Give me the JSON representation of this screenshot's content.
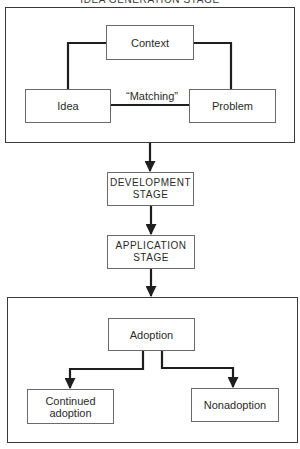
{
  "diagram": {
    "title": "IDEA GENERATION STAGE",
    "idea_stage": {
      "nodes": {
        "context": "Context",
        "idea": "Idea",
        "problem": "Problem"
      },
      "edge_label": "“Matching”"
    },
    "stages": [
      {
        "line1": "DEVELOPMENT",
        "line2": "STAGE"
      },
      {
        "line1": "APPLICATION",
        "line2": "STAGE"
      }
    ],
    "outcome_stage": {
      "nodes": {
        "adoption": "Adoption",
        "continued_line1": "Continued",
        "continued_line2": "adoption",
        "nonadoption": "Nonadoption"
      }
    },
    "colors": {
      "line": "#1e1e1e",
      "box_border": "#6a6a6a",
      "background": "#ffffff"
    }
  }
}
